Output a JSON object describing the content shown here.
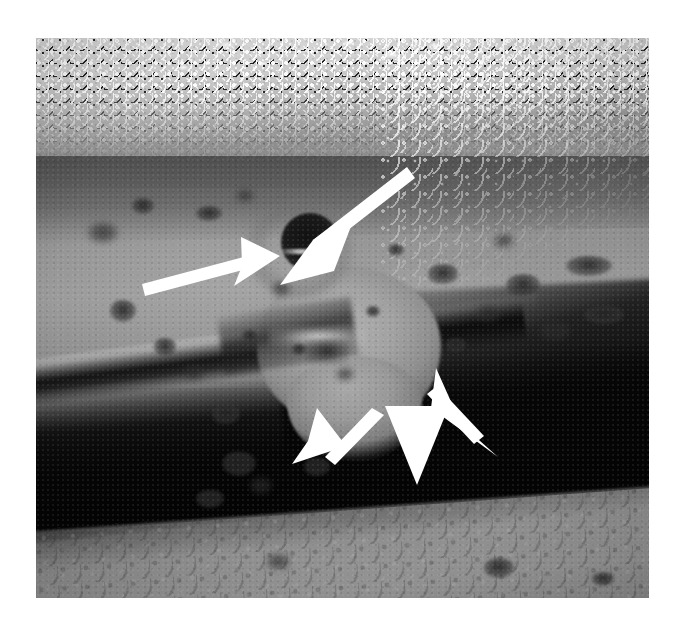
{
  "figure": {
    "kind": "photomicrograph",
    "modality": "grayscale endoscopic photograph",
    "caption": "",
    "background_color": "#ffffff",
    "image_frame": {
      "left": 36,
      "top": 38,
      "width": 613,
      "height": 560
    },
    "palette": {
      "paper_white": "#ffffff",
      "foam_highlight": "#ffffff",
      "mucosa_light": "#b0b0b0",
      "mucosa_mid": "#8d8d8d",
      "mucosa_dark": "#5a5a5a",
      "shadow_black": "#050505",
      "annotation_white": "#ffffff"
    },
    "regions": [
      {
        "name": "foamy-luminal-band",
        "label": "speckled foam / bubbles along upper margin"
      },
      {
        "name": "upper-mucosal-ridge",
        "label": "dark mucosal ridge"
      },
      {
        "name": "mid-plateau",
        "label": "light mucosal fold"
      },
      {
        "name": "diagonal-groove",
        "label": "dark fold crease"
      },
      {
        "name": "black-shadow-band",
        "label": "deep luminal shadow"
      },
      {
        "name": "bottom-mucosal-band",
        "label": "lower mucosal wall"
      },
      {
        "name": "central-nodule",
        "label": "protruding nodular mass"
      },
      {
        "name": "central-crater",
        "label": "dark central depression"
      }
    ],
    "annotations": {
      "count": 5,
      "color": "#ffffff",
      "arrows": [
        {
          "name": "arrow-upper-right",
          "label": "arrow 1",
          "direction": "down-left",
          "tip": [
            313,
            240
          ],
          "tail": [
            406,
            167
          ]
        },
        {
          "name": "arrow-horizontal-left",
          "label": "arrow 2",
          "direction": "right",
          "tip": [
            278,
            256
          ],
          "tail": [
            142,
            284
          ]
        },
        {
          "name": "arrow-lower-left",
          "label": "arrow 3",
          "direction": "down-left",
          "tip": [
            327,
            478
          ],
          "tail": [
            377,
            414
          ]
        },
        {
          "name": "arrow-lower-center",
          "label": "arrow 4",
          "direction": "down",
          "tip": [
            417,
            487
          ],
          "tail": [
            417,
            418
          ]
        },
        {
          "name": "arrow-lower-right",
          "label": "arrow 5",
          "direction": "down-right",
          "tip": [
            498,
            457
          ],
          "tail": [
            437,
            410
          ]
        }
      ]
    },
    "spots": [
      {
        "x": 52,
        "y": 185,
        "w": 30,
        "h": 20
      },
      {
        "x": 96,
        "y": 160,
        "w": 22,
        "h": 16
      },
      {
        "x": 160,
        "y": 168,
        "w": 26,
        "h": 15
      },
      {
        "x": 200,
        "y": 152,
        "w": 18,
        "h": 12
      },
      {
        "x": 74,
        "y": 262,
        "w": 26,
        "h": 22
      },
      {
        "x": 118,
        "y": 300,
        "w": 22,
        "h": 18
      },
      {
        "x": 148,
        "y": 328,
        "w": 20,
        "h": 14
      },
      {
        "x": 176,
        "y": 366,
        "w": 28,
        "h": 20
      },
      {
        "x": 206,
        "y": 292,
        "w": 16,
        "h": 12
      },
      {
        "x": 236,
        "y": 244,
        "w": 18,
        "h": 14
      },
      {
        "x": 256,
        "y": 306,
        "w": 14,
        "h": 11
      },
      {
        "x": 186,
        "y": 414,
        "w": 34,
        "h": 24
      },
      {
        "x": 214,
        "y": 440,
        "w": 22,
        "h": 16
      },
      {
        "x": 160,
        "y": 452,
        "w": 28,
        "h": 18
      },
      {
        "x": 392,
        "y": 226,
        "w": 30,
        "h": 20
      },
      {
        "x": 440,
        "y": 268,
        "w": 24,
        "h": 16
      },
      {
        "x": 410,
        "y": 300,
        "w": 20,
        "h": 14
      },
      {
        "x": 470,
        "y": 236,
        "w": 34,
        "h": 22
      },
      {
        "x": 504,
        "y": 284,
        "w": 30,
        "h": 18
      },
      {
        "x": 530,
        "y": 218,
        "w": 46,
        "h": 20
      },
      {
        "x": 548,
        "y": 268,
        "w": 40,
        "h": 18
      },
      {
        "x": 458,
        "y": 196,
        "w": 20,
        "h": 14
      },
      {
        "x": 352,
        "y": 206,
        "w": 16,
        "h": 12
      },
      {
        "x": 330,
        "y": 268,
        "w": 14,
        "h": 11
      },
      {
        "x": 300,
        "y": 330,
        "w": 18,
        "h": 13
      },
      {
        "x": 268,
        "y": 420,
        "w": 26,
        "h": 18
      },
      {
        "x": 448,
        "y": 520,
        "w": 30,
        "h": 20
      },
      {
        "x": 230,
        "y": 516,
        "w": 24,
        "h": 16
      },
      {
        "x": 556,
        "y": 534,
        "w": 22,
        "h": 14
      }
    ]
  }
}
